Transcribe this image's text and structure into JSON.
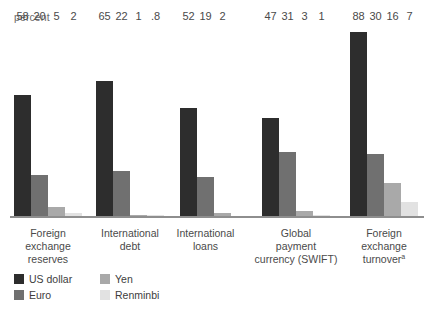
{
  "chart_data": {
    "type": "bar",
    "title": "",
    "subtitle": "",
    "xlabel": "",
    "ylabel": "percent",
    "unit_label": "percent",
    "ylim": [
      0,
      92
    ],
    "grid": false,
    "legend_position": "bottom-left",
    "orientation": "vertical",
    "grouping": "grouped",
    "categories": [
      "Foreign exchange reserves",
      "International debt",
      "International loans",
      "Global payment currency (SWIFT)",
      "Foreign exchange turnover"
    ],
    "category_lines": [
      [
        "Foreign",
        "exchange",
        "reserves"
      ],
      [
        "International",
        "debt"
      ],
      [
        "International",
        "loans"
      ],
      [
        "Global",
        "payment",
        "currency (SWIFT)"
      ],
      [
        "Foreign",
        "exchange",
        "turnover"
      ]
    ],
    "category_footnote_marks": [
      "",
      "",
      "",
      "",
      "a"
    ],
    "series": [
      {
        "name": "US dollar",
        "color": "#2d2d2d",
        "values": [
          58,
          65,
          52,
          47,
          88
        ],
        "labels": [
          "58",
          "65",
          "52",
          "47",
          "88"
        ]
      },
      {
        "name": "Euro",
        "color": "#707070",
        "values": [
          20,
          22,
          19,
          31,
          30
        ],
        "labels": [
          "20",
          "22",
          "19",
          "31",
          "30"
        ]
      },
      {
        "name": "Yen",
        "color": "#a9a9a9",
        "values": [
          5,
          1,
          2,
          3,
          16
        ],
        "labels": [
          "5",
          "1",
          "2",
          "3",
          "16"
        ]
      },
      {
        "name": "Renminbi",
        "color": "#e2e2e2",
        "values": [
          2,
          0.8,
          null,
          1,
          7
        ],
        "labels": [
          "2",
          ".8",
          "",
          "1",
          "7"
        ]
      }
    ],
    "colors": {
      "us_dollar": "#2d2d2d",
      "euro": "#707070",
      "yen": "#a9a9a9",
      "renminbi": "#e2e2e2",
      "axis": "#8e8e8e",
      "text": "#4a4a4a",
      "background": "#ffffff"
    }
  },
  "legend": {
    "items": [
      {
        "label": "US dollar",
        "color": "#2d2d2d"
      },
      {
        "label": "Yen",
        "color": "#a9a9a9"
      },
      {
        "label": "Euro",
        "color": "#707070"
      },
      {
        "label": "Renminbi",
        "color": "#e2e2e2"
      }
    ]
  }
}
